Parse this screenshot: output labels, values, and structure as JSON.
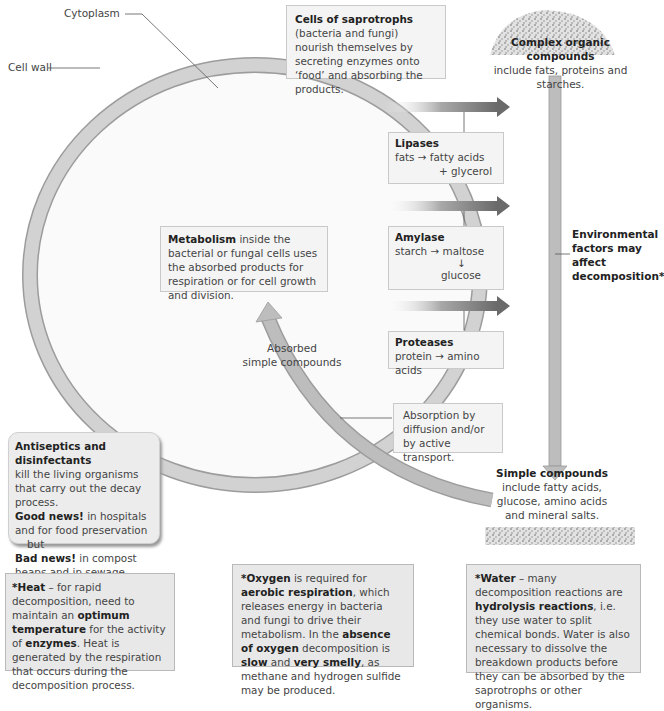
{
  "labels": {
    "cytoplasm": "Cytoplasm",
    "cell_wall": "Cell wall",
    "absorbed": [
      "Absorbed",
      "simple compounds"
    ]
  },
  "saprotrophs_box": {
    "bold": "Cells of saprotrophs",
    "text": " (bacteria and fungi) nourish themselves by secreting enzymes onto ‘food’ and absorbing the products."
  },
  "complex_compounds": {
    "title": "Complex organic compounds",
    "text": "include fats, proteins and starches."
  },
  "enzymes": [
    {
      "name": "Lipases",
      "line1": "fats → fatty acids",
      "line2": "+ glycerol"
    },
    {
      "name": "Amylase",
      "line1": "starch → maltose",
      "line2": "↓",
      "line3": "glucose"
    },
    {
      "name": "Proteases",
      "line1": "protein → amino acids"
    }
  ],
  "environmental": {
    "text": [
      "Environmental",
      "factors may",
      "affect",
      "decomposition*"
    ]
  },
  "metabolism_box": {
    "bold": "Metabolism",
    "text": " inside the bacterial or fungal cells uses the absorbed products for respiration or for cell growth and division."
  },
  "absorption_box": {
    "text": [
      "Absorption by",
      "diffusion and/or",
      "by active transport."
    ]
  },
  "simple_compounds": {
    "title": "Simple compounds",
    "text": [
      "include fatty acids,",
      "glucose, amino acids",
      "and mineral salts."
    ]
  },
  "antiseptics_box": {
    "title": "Antiseptics and disinfectants",
    "line1": "kill the living organisms that carry out the decay process.",
    "good_bold": "Good news!",
    "good_text": " in hospitals and for food preservation",
    "but": "but",
    "bad_bold": "Bad news!",
    "bad_text": " in compost heaps and in sewage works."
  },
  "factors": {
    "heat": {
      "segments": [
        {
          "b": "*Heat"
        },
        {
          "t": " – for rapid decomposition, need to maintain an "
        },
        {
          "b": "optimum temperature"
        },
        {
          "t": " for the activity of "
        },
        {
          "b": "enzymes"
        },
        {
          "t": ". Heat is generated by the respiration that occurs during the decomposition process."
        }
      ]
    },
    "oxygen": {
      "segments": [
        {
          "b": "*Oxygen"
        },
        {
          "t": " is required for "
        },
        {
          "b": "aerobic respiration"
        },
        {
          "t": ", which releases energy in bacteria and fungi to drive their metabolism. In the "
        },
        {
          "b": "absence of oxygen"
        },
        {
          "t": " decomposition is "
        },
        {
          "b": "slow"
        },
        {
          "t": " and "
        },
        {
          "b": "very smelly"
        },
        {
          "t": ", as methane and hydrogen sulfide may be produced."
        }
      ]
    },
    "water": {
      "segments": [
        {
          "b": "*Water"
        },
        {
          "t": " – many decomposition reactions are "
        },
        {
          "b": "hydrolysis reactions"
        },
        {
          "t": ", i.e. they use water to split chemical bonds. Water is also necessary to dissolve the breakdown products before they can be absorbed by the saprotrophs or other organisms."
        }
      ]
    }
  },
  "colors": {
    "cell_wall": "#cfcfcf",
    "arrow_dark": "#6e6e6e",
    "box_bg": "#f4f4f4",
    "factor_bg": "#e8e8e8"
  }
}
